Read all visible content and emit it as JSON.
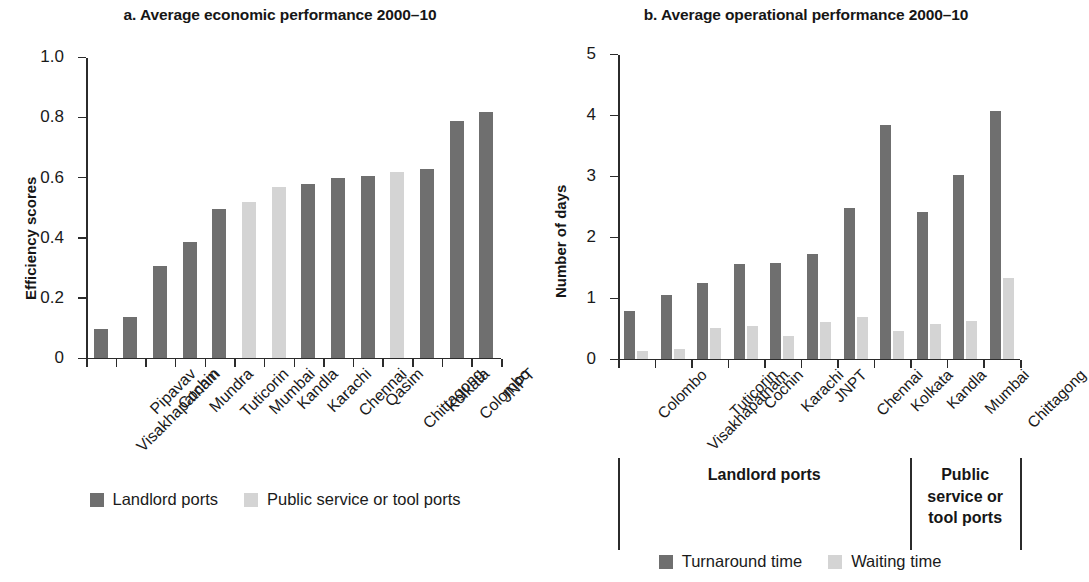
{
  "chart_data": [
    {
      "type": "bar",
      "panel": "a",
      "title": "a. Average economic performance 2000–10",
      "xlabel": "",
      "ylabel": "Efficiency scores",
      "ylim": [
        0,
        1.0
      ],
      "yticks": [
        "0",
        "0.2",
        "0.4",
        "0.6",
        "0.8",
        "1.0"
      ],
      "ytick_values": [
        0,
        0.2,
        0.4,
        0.6,
        0.8,
        1.0
      ],
      "grid": false,
      "legend_position": "bottom",
      "categories": [
        "Visakhapatnam",
        "Pipavav",
        "Cochin",
        "Mundra",
        "Tuticorin",
        "Mumbai",
        "Kandla",
        "Karachi",
        "Chennai",
        "Qasim",
        "Chittagong",
        "Kolkata",
        "Colombo",
        "JNPT"
      ],
      "values": [
        0.095,
        0.135,
        0.305,
        0.385,
        0.495,
        0.52,
        0.57,
        0.58,
        0.6,
        0.605,
        0.62,
        0.63,
        0.79,
        0.82
      ],
      "bar_types": [
        "dark",
        "dark",
        "dark",
        "dark",
        "dark",
        "light",
        "light",
        "dark",
        "dark",
        "dark",
        "light",
        "dark",
        "dark",
        "dark"
      ],
      "legend": [
        {
          "label": "Landlord ports",
          "type": "dark",
          "color": "#6f6f6f"
        },
        {
          "label": "Public service or tool ports",
          "type": "light",
          "color": "#d4d4d4"
        }
      ]
    },
    {
      "type": "bar",
      "panel": "b",
      "title": "b. Average operational performance 2000–10",
      "xlabel": "",
      "ylabel": "Number of days",
      "ylim": [
        0,
        5
      ],
      "yticks": [
        "0",
        "1",
        "2",
        "3",
        "4",
        "5"
      ],
      "ytick_values": [
        0,
        1,
        2,
        3,
        4,
        5
      ],
      "grid": false,
      "legend_position": "bottom",
      "categories": [
        "Colombo",
        "Visakhapatnam",
        "Tuticorin",
        "Cochin",
        "Karachi",
        "JNPT",
        "Chennai",
        "Kolkata",
        "Kandla",
        "Mumbai",
        "Chittagong"
      ],
      "series": [
        {
          "name": "Turnaround time",
          "type": "dark",
          "color": "#6f6f6f",
          "values": [
            0.78,
            1.05,
            1.25,
            1.55,
            1.58,
            1.72,
            2.48,
            3.85,
            2.42,
            3.03,
            4.08
          ]
        },
        {
          "name": "Waiting time",
          "type": "light",
          "color": "#d4d4d4",
          "values": [
            0.12,
            0.15,
            0.5,
            0.53,
            0.37,
            0.6,
            0.68,
            0.46,
            0.57,
            0.61,
            1.33
          ]
        }
      ],
      "groups": [
        {
          "label": "Landlord ports",
          "start": 0,
          "end": 8
        },
        {
          "label": "Public\nservice or\ntool ports",
          "start": 8,
          "end": 11
        }
      ],
      "legend": [
        {
          "label": "Turnaround time",
          "type": "dark",
          "color": "#6f6f6f"
        },
        {
          "label": "Waiting time",
          "type": "light",
          "color": "#d4d4d4"
        }
      ]
    }
  ],
  "panel_a": {
    "title": "a. Average economic performance 2000–10",
    "ylabel": "Efficiency scores",
    "legend": {
      "item1": "Landlord ports",
      "item2": "Public service or tool ports"
    }
  },
  "panel_b": {
    "title": "b. Average operational performance 2000–10",
    "ylabel": "Number of days",
    "group1": "Landlord ports",
    "group2_line1": "Public",
    "group2_line2": "service or",
    "group2_line3": "tool ports",
    "legend": {
      "item1": "Turnaround time",
      "item2": "Waiting time"
    }
  },
  "colors": {
    "dark_bar": "#6f6f6f",
    "light_bar": "#d4d4d4",
    "axis": "#2b2b2b",
    "text": "#1a1a1a",
    "background": "#ffffff"
  }
}
